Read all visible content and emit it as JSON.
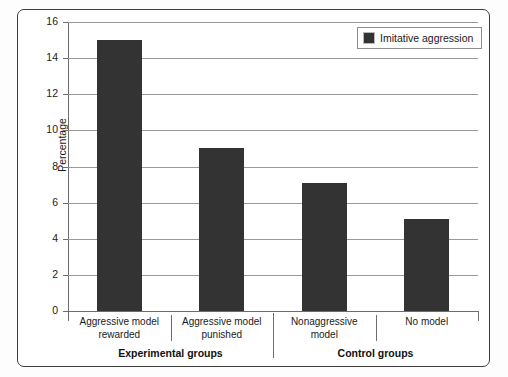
{
  "chart_data": {
    "type": "bar",
    "title": "",
    "xlabel": "",
    "ylabel": "Percentage",
    "ylim": [
      0,
      16
    ],
    "ytick_step": 2,
    "yticks": [
      0,
      2,
      4,
      6,
      8,
      10,
      12,
      14,
      16
    ],
    "ytick_labels": [
      "0",
      "2",
      "4",
      "6",
      "8",
      "10",
      "12",
      "14",
      "16"
    ],
    "grid": true,
    "legend_position": "top-right",
    "categories": [
      "Aggressive model rewarded",
      "Aggressive model punished",
      "Nonaggressive model",
      "No model"
    ],
    "category_lines": [
      [
        "Aggressive model",
        "rewarded"
      ],
      [
        "Aggressive model",
        "punished"
      ],
      [
        "Nonaggressive",
        "model"
      ],
      [
        "No model",
        ""
      ]
    ],
    "series": [
      {
        "name": "Imitative aggression",
        "color": "#333333",
        "values": [
          15.0,
          9.0,
          7.1,
          5.1
        ]
      }
    ],
    "group_labels": [
      "Experimental groups",
      "Control groups"
    ],
    "groups": [
      {
        "label": "Experimental groups",
        "categories": [
          "Aggressive model rewarded",
          "Aggressive model punished"
        ]
      },
      {
        "label": "Control groups",
        "categories": [
          "Nonaggressive model",
          "No model"
        ]
      }
    ]
  },
  "legend": {
    "entries": [
      {
        "label": "Imitative aggression",
        "color": "#333333",
        "swatch": "legend-color-swatch"
      }
    ]
  },
  "colors": {
    "bar": "#333333",
    "gridline": "#9a9a9a",
    "axis": "#6d6d6d",
    "frame": "#3c3c3c",
    "background": "#ffffff"
  }
}
